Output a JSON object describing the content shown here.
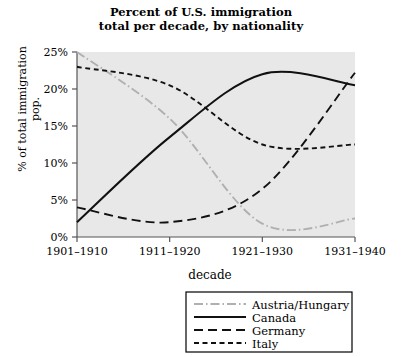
{
  "chart_data": {
    "type": "line",
    "title": "Percent of U.S. immigration total per decade, by nationality",
    "title_line1": "Percent of U.S. immigration",
    "title_line2": "total per decade, by nationality",
    "xlabel": "decade",
    "ylabel": "% of total immigration pop.",
    "ylabel_line1": "% of total immigration",
    "ylabel_line2": "pop.",
    "categories": [
      "1901–1910",
      "1911–1920",
      "1921–1930",
      "1931–1940"
    ],
    "ylim": [
      0,
      25
    ],
    "ytick_values": [
      0,
      5,
      10,
      15,
      20,
      25
    ],
    "ytick_labels": [
      "0%",
      "5%",
      "10%",
      "15%",
      "20%",
      "25%"
    ],
    "grid": false,
    "plot_background": "#e8e8e8",
    "legend_position": "below-right",
    "series": [
      {
        "name": "Austria/Hungary",
        "values": [
          25.0,
          16.0,
          1.8,
          2.5
        ],
        "style": "dash-dot",
        "color": "#b0b0b0"
      },
      {
        "name": "Canada",
        "values": [
          2.0,
          13.5,
          22.0,
          20.5
        ],
        "style": "solid",
        "color": "#111111"
      },
      {
        "name": "Germany",
        "values": [
          4.0,
          2.0,
          6.5,
          22.2
        ],
        "style": "long-dash",
        "color": "#111111"
      },
      {
        "name": "Italy",
        "values": [
          23.0,
          20.5,
          12.5,
          12.5
        ],
        "style": "short-dash",
        "color": "#111111"
      }
    ]
  },
  "legend": {
    "items": [
      {
        "label": "Austria/Hungary"
      },
      {
        "label": "Canada"
      },
      {
        "label": "Germany"
      },
      {
        "label": "Italy"
      }
    ]
  }
}
